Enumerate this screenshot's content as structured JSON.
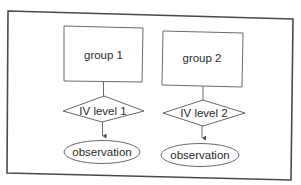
{
  "diagram": {
    "type": "flowchart",
    "frame": {
      "stroke": "#4a4a4a",
      "background": "#ffffff"
    },
    "columns": [
      {
        "group_label": "group 1",
        "condition_label": "IV level 1",
        "outcome_label": "observation"
      },
      {
        "group_label": "group 2",
        "condition_label": "IV level 2",
        "outcome_label": "observation"
      }
    ],
    "edges": [
      {
        "from": "group 1",
        "to": "IV level 1"
      },
      {
        "from": "IV level 1",
        "to": "observation (1)",
        "arrow": true
      },
      {
        "from": "group 2",
        "to": "IV level 2"
      },
      {
        "from": "IV level 2",
        "to": "observation (2)",
        "arrow": true
      }
    ]
  }
}
